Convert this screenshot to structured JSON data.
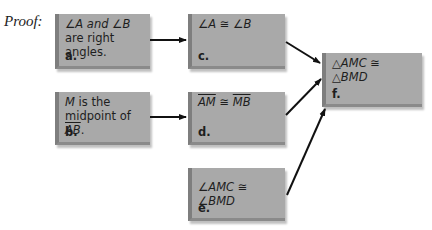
{
  "proof_label": "Proof:",
  "boxes": {
    "a": {
      "line1": "∠A and ∠B",
      "line2": "are right angles.",
      "tag": "a."
    },
    "b": {
      "line1_var": "M",
      "line1_rest": " is the",
      "line2_pre": "midpoint of ",
      "line2_seg": "AB",
      "line2_post": ".",
      "tag": "b."
    },
    "c": {
      "statement": "∠A ≅ ∠B",
      "tag": "c."
    },
    "d": {
      "seg1": "AM",
      "op": " ≅ ",
      "seg2": "MB",
      "tag": "d."
    },
    "e": {
      "statement": "∠AMC ≅ ∠BMD",
      "tag": "e."
    },
    "f": {
      "statement": "△AMC ≅ △BMD",
      "tag": "f."
    }
  },
  "arrows": [
    {
      "from": "a",
      "to": "c"
    },
    {
      "from": "b",
      "to": "d"
    },
    {
      "from": "c",
      "to": "f"
    },
    {
      "from": "d",
      "to": "f"
    },
    {
      "from": "e",
      "to": "f"
    }
  ],
  "colors": {
    "box_fill": "#a9a9a9",
    "box_edge": "#7e7e7e",
    "arrow": "#111111"
  }
}
